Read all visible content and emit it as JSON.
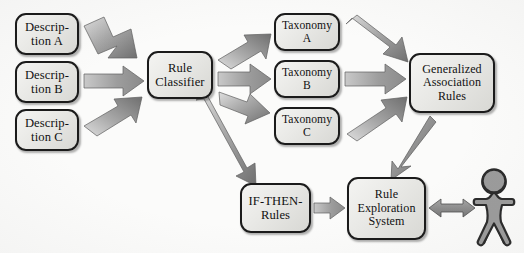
{
  "diagram": {
    "background_color": "#fbfbfa",
    "node_border_color": "#1b1b1b",
    "node_fill_light": "#f4f4f2",
    "node_fill_dark": "#d8d8d4",
    "arrow_fill_light": "#d9d9d6",
    "arrow_fill_dark": "#7e7e7e",
    "nodes": [
      {
        "id": "description-a",
        "label": "Descrip-\ntion A",
        "x": 15,
        "y": 13,
        "w": 64,
        "h": 42,
        "size": "fs13"
      },
      {
        "id": "description-b",
        "label": "Descrip-\ntion B",
        "x": 15,
        "y": 61,
        "w": 64,
        "h": 42,
        "size": "fs13"
      },
      {
        "id": "description-c",
        "label": "Descrip-\ntion C",
        "x": 15,
        "y": 109,
        "w": 64,
        "h": 42,
        "size": "fs13"
      },
      {
        "id": "rule-classifier",
        "label": "Rule\nClassifier",
        "x": 147,
        "y": 51,
        "w": 66,
        "h": 48,
        "size": "fs13"
      },
      {
        "id": "taxonomy-a",
        "label": "Taxonomy\nA",
        "x": 274,
        "y": 13,
        "w": 66,
        "h": 38,
        "size": "fs12"
      },
      {
        "id": "taxonomy-b",
        "label": "Taxonomy\nB",
        "x": 274,
        "y": 60,
        "w": 66,
        "h": 38,
        "size": "fs12"
      },
      {
        "id": "taxonomy-c",
        "label": "Taxonomy\nC",
        "x": 274,
        "y": 107,
        "w": 66,
        "h": 38,
        "size": "fs12"
      },
      {
        "id": "generalized-association-rules",
        "label": "Generalized\nAssociation\nRules",
        "x": 409,
        "y": 53,
        "w": 86,
        "h": 60,
        "size": "fs125"
      },
      {
        "id": "if-then-rules",
        "label": "IF-THEN-\nRules",
        "x": 240,
        "y": 183,
        "w": 71,
        "h": 50,
        "size": "fs13"
      },
      {
        "id": "rule-exploration-system",
        "label": "Rule\nExploration\nSystem",
        "x": 347,
        "y": 177,
        "w": 79,
        "h": 63,
        "size": "fs125"
      }
    ],
    "actor": {
      "id": "user-person",
      "label": "user"
    },
    "edges": [
      {
        "id": "desc-a-to-classifier",
        "from": "description-a",
        "to": "rule-classifier",
        "style": "block-arrow-diagonal-down"
      },
      {
        "id": "desc-b-to-classifier",
        "from": "description-b",
        "to": "rule-classifier",
        "style": "block-arrow-horizontal"
      },
      {
        "id": "desc-c-to-classifier",
        "from": "description-c",
        "to": "rule-classifier",
        "style": "block-arrow-diagonal-up"
      },
      {
        "id": "classifier-to-taxonomy-a",
        "from": "rule-classifier",
        "to": "taxonomy-a",
        "style": "block-arrow-diagonal-up"
      },
      {
        "id": "classifier-to-taxonomy-b",
        "from": "rule-classifier",
        "to": "taxonomy-b",
        "style": "block-arrow-horizontal"
      },
      {
        "id": "classifier-to-taxonomy-c",
        "from": "rule-classifier",
        "to": "taxonomy-c",
        "style": "block-arrow-diagonal-down"
      },
      {
        "id": "classifier-to-if-then-rules",
        "from": "rule-classifier",
        "to": "if-then-rules",
        "style": "block-arrow-diagonal-down-long"
      },
      {
        "id": "taxonomy-a-to-gar",
        "from": "taxonomy-a",
        "to": "generalized-association-rules",
        "style": "block-arrow-diagonal-down"
      },
      {
        "id": "taxonomy-b-to-gar",
        "from": "taxonomy-b",
        "to": "generalized-association-rules",
        "style": "block-arrow-horizontal"
      },
      {
        "id": "taxonomy-c-to-gar",
        "from": "taxonomy-c",
        "to": "generalized-association-rules",
        "style": "block-arrow-diagonal-up"
      },
      {
        "id": "gar-to-rule-exploration-system",
        "from": "generalized-association-rules",
        "to": "rule-exploration-system",
        "style": "thin-arrow-diagonal-down"
      },
      {
        "id": "if-then-rules-to-rule-exploration-system",
        "from": "if-then-rules",
        "to": "rule-exploration-system",
        "style": "block-arrow-horizontal-small"
      },
      {
        "id": "rule-exploration-system-to-user",
        "from": "rule-exploration-system",
        "to": "user-person",
        "style": "double-headed-arrow"
      }
    ]
  }
}
